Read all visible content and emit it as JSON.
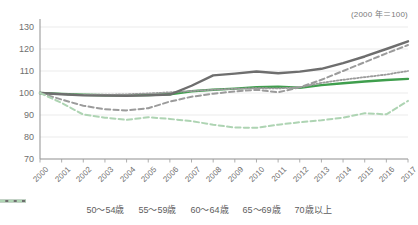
{
  "chart_data": {
    "type": "line",
    "title": "",
    "subtitle": "",
    "annotation": "(2000 年＝100)",
    "xlabel": "",
    "ylabel": "",
    "grid": true,
    "legend_position": "bottom",
    "xlim": [
      2000,
      2017
    ],
    "ylim": [
      70,
      130
    ],
    "ytick_step": 10,
    "x": [
      2000,
      2001,
      2002,
      2003,
      2004,
      2005,
      2006,
      2007,
      2008,
      2009,
      2010,
      2011,
      2012,
      2013,
      2014,
      2015,
      2016,
      2017
    ],
    "yticks": [
      70,
      80,
      90,
      100,
      110,
      120,
      130
    ],
    "series": [
      {
        "name": "50〜54歳",
        "color": "#3f9e4d",
        "style": "solid",
        "width": 2.4,
        "values": [
          100.0,
          99.6,
          99.2,
          99.0,
          98.9,
          99.1,
          99.4,
          100.8,
          101.5,
          102.0,
          102.6,
          102.9,
          102.4,
          103.6,
          104.4,
          105.2,
          105.9,
          106.4
        ]
      },
      {
        "name": "55〜59歳",
        "color": "#9b9b9b",
        "style": "dotted",
        "width": 1.8,
        "values": [
          100.0,
          99.5,
          99.2,
          99.2,
          99.4,
          99.8,
          100.3,
          100.9,
          101.5,
          101.9,
          102.2,
          102.1,
          102.6,
          104.6,
          106.0,
          107.2,
          108.4,
          110.0
        ]
      },
      {
        "name": "60〜64歳",
        "color": "#6e6e6e",
        "style": "solid",
        "width": 2.4,
        "values": [
          100.0,
          99.4,
          98.9,
          98.8,
          98.7,
          98.9,
          99.3,
          103.3,
          108.0,
          108.8,
          109.8,
          109.0,
          109.7,
          111.0,
          113.6,
          116.6,
          120.0,
          123.5
        ]
      },
      {
        "name": "65〜69歳",
        "color": "#9b9b9b",
        "style": "dashed",
        "width": 2.0,
        "values": [
          100.0,
          97.0,
          94.2,
          92.6,
          92.1,
          93.1,
          96.1,
          98.3,
          99.7,
          100.7,
          101.5,
          100.3,
          102.6,
          106.0,
          110.0,
          114.0,
          118.0,
          121.8
        ]
      },
      {
        "name": "70歳以上",
        "color": "#aed4b3",
        "style": "dashed",
        "width": 2.0,
        "values": [
          100.0,
          95.5,
          90.2,
          88.8,
          87.8,
          89.0,
          88.2,
          87.2,
          85.6,
          84.3,
          84.2,
          85.6,
          86.7,
          87.6,
          88.8,
          90.8,
          90.3,
          96.4
        ]
      }
    ]
  },
  "axis": {
    "ytick_labels": [
      "130",
      "120",
      "110",
      "100",
      "90",
      "80",
      "70"
    ],
    "xtick_labels": [
      "2000",
      "2001",
      "2002",
      "2003",
      "2004",
      "2005",
      "2006",
      "2007",
      "2008",
      "2009",
      "2010",
      "2011",
      "2012",
      "2013",
      "2014",
      "2015",
      "2016",
      "2017"
    ]
  },
  "legend": {
    "items": [
      {
        "label": "50〜54歳",
        "color": "#3f9e4d",
        "style": "solid"
      },
      {
        "label": "55〜59歳",
        "color": "#9b9b9b",
        "style": "dotted"
      },
      {
        "label": "60〜64歳",
        "color": "#6e6e6e",
        "style": "solid"
      },
      {
        "label": "65〜69歳",
        "color": "#9b9b9b",
        "style": "dashed"
      },
      {
        "label": "70歳以上",
        "color": "#aed4b3",
        "style": "dashed"
      }
    ]
  }
}
